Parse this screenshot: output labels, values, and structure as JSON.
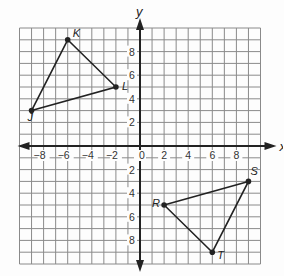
{
  "chart_data": {
    "type": "scatter",
    "title": "",
    "xlabel": "x",
    "ylabel": "y",
    "xlim": [
      -10,
      10
    ],
    "ylim": [
      -10,
      10
    ],
    "grid": true,
    "grid_step": 1,
    "x_ticks": [
      -8,
      -6,
      -4,
      -2,
      0,
      2,
      4,
      6,
      8
    ],
    "y_ticks": [
      -8,
      -6,
      -4,
      -2,
      2,
      4,
      6,
      8
    ],
    "x_tick_labels": [
      "−8",
      "−6",
      "−4",
      "−2",
      "0",
      "2",
      "4",
      "6",
      "8"
    ],
    "y_tick_labels": [
      "8",
      "6",
      "4",
      "2",
      "2",
      "4",
      "6",
      "8"
    ],
    "series": [
      {
        "name": "Triangle JKL",
        "closed": true,
        "points": [
          {
            "label": "J",
            "x": -9,
            "y": 3
          },
          {
            "label": "K",
            "x": -6,
            "y": 9
          },
          {
            "label": "L",
            "x": -2,
            "y": 5
          }
        ]
      },
      {
        "name": "Triangle RST",
        "closed": true,
        "points": [
          {
            "label": "R",
            "x": 2,
            "y": -5
          },
          {
            "label": "S",
            "x": 9,
            "y": -3
          },
          {
            "label": "T",
            "x": 6,
            "y": -9
          }
        ]
      }
    ]
  },
  "colors": {
    "grid": "#8a8a8a",
    "axis": "#222222",
    "shape": "#222222"
  }
}
